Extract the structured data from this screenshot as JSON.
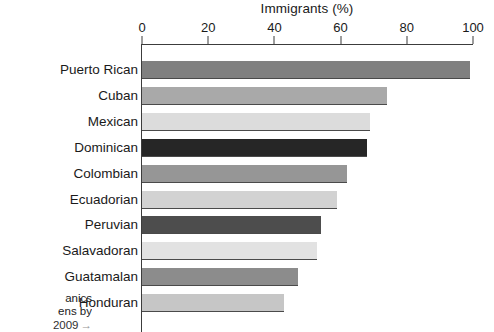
{
  "chart_data": {
    "type": "bar",
    "orientation": "horizontal",
    "title": "Immigrants (%)",
    "xlabel": "Immigrants (%)",
    "ylabel": "",
    "xlim": [
      0,
      100
    ],
    "xticks": [
      0,
      20,
      40,
      60,
      80,
      100
    ],
    "xtick_labels": [
      "0",
      "20",
      "40",
      "60",
      "80",
      "100"
    ],
    "grid": false,
    "legend": false,
    "categories": [
      "Puerto Rican",
      "Cuban",
      "Mexican",
      "Dominican",
      "Colombian",
      "Ecuadorian",
      "Peruvian",
      "Salavadoran",
      "Guatamalan",
      "Honduran"
    ],
    "values": [
      99,
      74,
      69,
      68,
      62,
      59,
      54,
      53,
      47,
      43
    ],
    "bar_colors": [
      "#808080",
      "#a9a9a9",
      "#dcdcdc",
      "#262626",
      "#969696",
      "#d2d2d2",
      "#4d4d4d",
      "#e2e2e2",
      "#8c8c8c",
      "#c6c6c6"
    ],
    "bar_edge_color": "#4a4a4a",
    "axis_color": "#3c3c3c",
    "background_color": "#ffffff"
  },
  "caption_fragment": {
    "line1": "anics",
    "line2": "ens by",
    "line3": "2009",
    "arrow": "→"
  }
}
